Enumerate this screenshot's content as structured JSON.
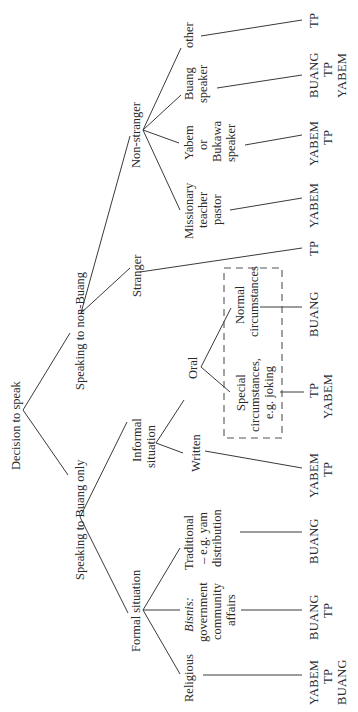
{
  "diagram": {
    "orientation": "rotated-90-counterclockwise",
    "root": "Decision to speak",
    "nodes": {
      "root": "Decision to speak",
      "buang_only": "Speaking to Buang only",
      "non_buang": "Speaking to non-Buang",
      "formal": "Formal situation",
      "informal": [
        "Informal",
        "situation"
      ],
      "stranger": "Stranger",
      "non_stranger": "Non-stranger",
      "religious": "Religious",
      "bisnis": [
        "Bisnis:",
        "government",
        "community",
        "affairs"
      ],
      "traditional": [
        "Traditional",
        "– e.g. yam",
        "distribution"
      ],
      "written": "Written",
      "oral": "Oral",
      "special": [
        "Special",
        "circumstances,",
        "e.g. joking"
      ],
      "normal": [
        "Normal",
        "circumstances"
      ],
      "missionary": [
        "Missionary",
        "teacher",
        "pastor"
      ],
      "yabem_speaker": [
        "Yabem",
        "or",
        "Bukawa",
        "speaker"
      ],
      "buang_speaker": [
        "Buang",
        "speaker"
      ],
      "other": "other"
    },
    "outcomes": {
      "religious": [
        "YABEM",
        "TP",
        "BUANG"
      ],
      "bisnis": [
        "BUANG",
        "TP"
      ],
      "traditional": [
        "BUANG"
      ],
      "written": [
        "YABEM",
        "TP"
      ],
      "special": [
        "TP",
        "YABEM"
      ],
      "normal": [
        "BUANG"
      ],
      "stranger": [
        "TP"
      ],
      "missionary": [
        "YABEM"
      ],
      "yabem_speaker": [
        "YABEM",
        "TP"
      ],
      "buang_speaker": [
        "BUANG",
        "TP",
        "YABEM"
      ],
      "other": [
        "TP"
      ]
    }
  }
}
